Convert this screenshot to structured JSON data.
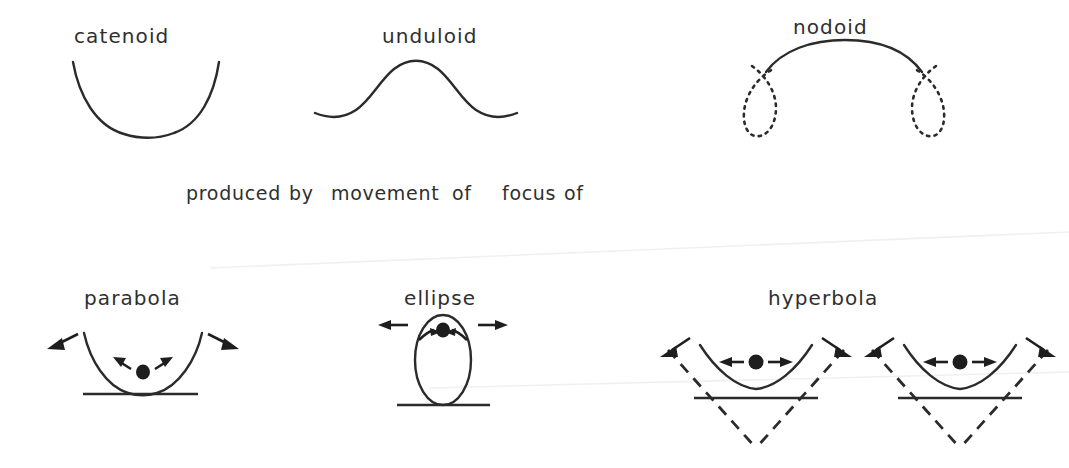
{
  "figure": {
    "background_color": "#ffffff",
    "ink_color": "#2b2b2b",
    "top_row": {
      "items": [
        {
          "label": "catenoid",
          "curve_kind": "catenary-open-upward"
        },
        {
          "label": "unduloid",
          "curve_kind": "sine-wave-single-hump"
        },
        {
          "label": "nodoid",
          "curve_kind": "arc-with-dotted-loops"
        }
      ]
    },
    "caption": {
      "full_text": "produced by movement of focus of",
      "words": [
        "produced",
        "by",
        "movement",
        "of",
        "focus",
        "of"
      ]
    },
    "bottom_row": {
      "items": [
        {
          "label": "parabola",
          "curve_kind": "parabola-on-baseline"
        },
        {
          "label": "ellipse",
          "curve_kind": "ellipse-on-baseline"
        },
        {
          "label": "hyperbola",
          "curve_kind": "two-hyperbola-branches-with-asymptotes"
        }
      ]
    }
  }
}
